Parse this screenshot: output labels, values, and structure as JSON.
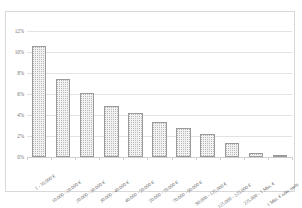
{
  "chart_data": {
    "type": "bar",
    "title": "",
    "subtitle": "",
    "xlabel": "",
    "ylabel": "",
    "ylim": [
      0,
      12
    ],
    "yticks": [
      "0%",
      "2%",
      "4%",
      "6%",
      "8%",
      "10%",
      "12%"
    ],
    "ytick_values": [
      0,
      2,
      4,
      6,
      8,
      10,
      12
    ],
    "grid": true,
    "legend": "none",
    "categories": [
      "1 - 10.000 €",
      "10.000 - 20.000 €",
      "20.000 - 30.000 €",
      "30.000 - 40.000 €",
      "40.000 - 50.000 €",
      "50.000 - 70.000 €",
      "70.000 - 90.000 €",
      "90.000 - 125.000 €",
      "125.000 - 225.000 €",
      "225.000 - 1 Mio. €",
      "1 Mio. € oder mehr"
    ],
    "values": [
      10.55,
      7.45,
      6.05,
      4.85,
      4.2,
      3.35,
      2.8,
      2.2,
      1.35,
      0.35,
      0.15
    ],
    "value_unit": "%",
    "bar_fill_color": "#f2f2f2",
    "bar_pattern": "dotted",
    "bar_border_color": "#9a9a9a",
    "gridline_color": "#e3e3e3",
    "axis_color": "#cfcfcf",
    "frame_border_color": "#d8d8d8"
  }
}
